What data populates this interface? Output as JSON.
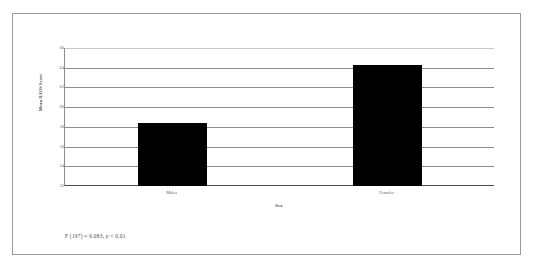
{
  "figure": {
    "annotation": "F (197) = 6.083, p < 0.01",
    "frame_color": "#9a9a9a",
    "bar_color": "#000000",
    "gridline_color": "#8d8d8d",
    "text_color": "#4a4a4a"
  },
  "chart_data": {
    "type": "bar",
    "title": "",
    "categories": [
      "Males",
      "Females"
    ],
    "values": [
      58.4,
      64.3
    ],
    "xlabel": "Sex",
    "ylabel": "Mean RADS Score",
    "ylim": [
      52,
      66
    ],
    "ytick_labels": [
      "66",
      "64",
      "62",
      "60",
      "58",
      "56",
      "54",
      "52"
    ],
    "ytick_values": [
      66,
      64,
      62,
      60,
      58,
      56,
      54,
      52
    ],
    "grid": true,
    "grid_axis": "y",
    "legend": false,
    "legend_position": "none",
    "annotations": [
      "F (197) = 6.083, p < 0.01"
    ]
  }
}
